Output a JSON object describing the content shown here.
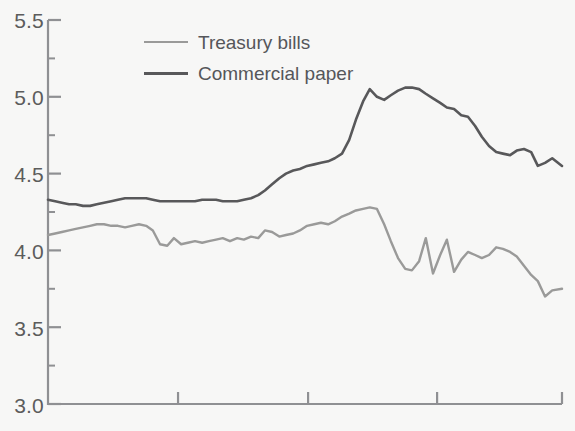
{
  "chart_data": {
    "type": "line",
    "title": "",
    "subtitle": "",
    "xlabel": "",
    "ylabel": "",
    "ylim": [
      3.0,
      5.5
    ],
    "xlim": [
      0,
      100
    ],
    "grid": false,
    "legend_position": "top-left-inside",
    "background_color": "#f7f7f6",
    "axis_color": "#8f9093",
    "y_ticks": [
      "3.0",
      "3.5",
      "4.0",
      "4.5",
      "5.0",
      "5.5"
    ],
    "y_tick_values": [
      3.0,
      3.5,
      4.0,
      4.5,
      5.0,
      5.5
    ],
    "y_minor_tick_values": [
      3.25,
      3.75,
      4.25,
      4.75,
      5.25
    ],
    "x_ticks": [
      "",
      "",
      "",
      ""
    ],
    "x_tick_positions": [
      25.3,
      50.6,
      75.7,
      100
    ],
    "series": [
      {
        "name": "Treasury bills",
        "color": "#9a9a99",
        "line_width": 2.4,
        "x": [
          0,
          1.4,
          2.7,
          4.1,
          5.4,
          6.8,
          8.2,
          9.5,
          10.9,
          12.3,
          13.6,
          15.0,
          16.3,
          17.7,
          19.1,
          20.4,
          21.8,
          23.2,
          24.5,
          25.9,
          27.2,
          28.6,
          30.0,
          31.3,
          32.7,
          34.0,
          35.4,
          36.8,
          38.1,
          39.5,
          40.9,
          42.2,
          43.6,
          45.0,
          46.3,
          47.7,
          49.0,
          50.4,
          51.8,
          53.1,
          54.5,
          55.8,
          57.2,
          58.6,
          59.9,
          61.3,
          62.6,
          64.0,
          65.4,
          66.7,
          68.1,
          69.5,
          70.8,
          72.2,
          73.5,
          74.9,
          76.3,
          77.6,
          79.0,
          80.4,
          81.7,
          83.1,
          84.4,
          85.8,
          87.2,
          88.5,
          89.9,
          91.2,
          92.6,
          94.0,
          95.3,
          96.7,
          98.1,
          100
        ],
        "y": [
          4.1,
          4.11,
          4.12,
          4.13,
          4.14,
          4.15,
          4.16,
          4.17,
          4.17,
          4.16,
          4.16,
          4.15,
          4.16,
          4.17,
          4.16,
          4.13,
          4.04,
          4.03,
          4.08,
          4.04,
          4.05,
          4.06,
          4.05,
          4.06,
          4.07,
          4.08,
          4.06,
          4.08,
          4.07,
          4.09,
          4.08,
          4.13,
          4.12,
          4.09,
          4.1,
          4.11,
          4.13,
          4.16,
          4.17,
          4.18,
          4.17,
          4.19,
          4.22,
          4.24,
          4.26,
          4.27,
          4.28,
          4.27,
          4.17,
          4.06,
          3.95,
          3.88,
          3.87,
          3.93,
          4.08,
          3.85,
          3.97,
          4.07,
          3.86,
          3.94,
          3.99,
          3.97,
          3.95,
          3.97,
          4.02,
          4.01,
          3.99,
          3.96,
          3.9,
          3.84,
          3.8,
          3.7,
          3.74,
          3.75
        ]
      },
      {
        "name": "Commercial paper",
        "color": "#58585a",
        "line_width": 2.6,
        "x": [
          0,
          1.4,
          2.7,
          4.1,
          5.4,
          6.8,
          8.2,
          9.5,
          10.9,
          12.3,
          13.6,
          15.0,
          16.3,
          17.7,
          19.1,
          20.4,
          21.8,
          23.2,
          24.5,
          25.9,
          27.2,
          28.6,
          30.0,
          31.3,
          32.7,
          34.0,
          35.4,
          36.8,
          38.1,
          39.5,
          40.9,
          42.2,
          43.6,
          45.0,
          46.3,
          47.7,
          49.0,
          50.4,
          51.8,
          53.1,
          54.5,
          55.8,
          57.2,
          58.6,
          59.9,
          61.3,
          62.6,
          64.0,
          65.4,
          66.7,
          68.1,
          69.5,
          70.8,
          72.2,
          73.5,
          74.9,
          76.3,
          77.6,
          79.0,
          80.4,
          81.7,
          83.1,
          84.4,
          85.8,
          87.2,
          88.5,
          89.9,
          91.2,
          92.6,
          94.0,
          95.3,
          96.7,
          98.1,
          100
        ],
        "y": [
          4.33,
          4.32,
          4.31,
          4.3,
          4.3,
          4.29,
          4.29,
          4.3,
          4.31,
          4.32,
          4.33,
          4.34,
          4.34,
          4.34,
          4.34,
          4.33,
          4.32,
          4.32,
          4.32,
          4.32,
          4.32,
          4.32,
          4.33,
          4.33,
          4.33,
          4.32,
          4.32,
          4.32,
          4.33,
          4.34,
          4.36,
          4.39,
          4.43,
          4.47,
          4.5,
          4.52,
          4.53,
          4.55,
          4.56,
          4.57,
          4.58,
          4.6,
          4.63,
          4.72,
          4.85,
          4.97,
          5.05,
          5.0,
          4.98,
          5.01,
          5.04,
          5.06,
          5.06,
          5.05,
          5.02,
          4.99,
          4.96,
          4.93,
          4.92,
          4.88,
          4.87,
          4.81,
          4.74,
          4.68,
          4.64,
          4.63,
          4.62,
          4.65,
          4.66,
          4.64,
          4.55,
          4.57,
          4.6,
          4.55
        ]
      }
    ]
  },
  "legend": {
    "items": [
      {
        "label": "Treasury bills",
        "color": "#9a9a99"
      },
      {
        "label": "Commercial paper",
        "color": "#58585a"
      }
    ]
  },
  "axis": {
    "y_labels": [
      "5.5",
      "5.0",
      "4.5",
      "4.0",
      "3.5",
      "3.0"
    ]
  }
}
